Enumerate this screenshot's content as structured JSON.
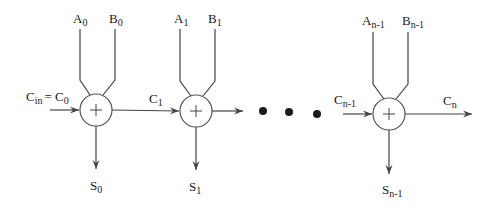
{
  "diagram": {
    "type": "ripple-carry-adder",
    "colors": {
      "line": "#444444",
      "text": "#1a1a1a",
      "background": "#ffffff"
    },
    "adders": [
      {
        "id": "adder-0",
        "symbol": "+",
        "inputs": {
          "a": {
            "base": "A",
            "sub": "0"
          },
          "b": {
            "base": "B",
            "sub": "0"
          }
        },
        "carry_in": {
          "base": "C",
          "sub": "in",
          "equals": "= ",
          "base2": "C",
          "sub2": "0"
        },
        "carry_out": {
          "base": "C",
          "sub": "1"
        },
        "sum": {
          "base": "S",
          "sub": "0"
        }
      },
      {
        "id": "adder-1",
        "symbol": "+",
        "inputs": {
          "a": {
            "base": "A",
            "sub": "1"
          },
          "b": {
            "base": "B",
            "sub": "1"
          }
        },
        "sum": {
          "base": "S",
          "sub": "1"
        }
      },
      {
        "id": "adder-n-1",
        "symbol": "+",
        "inputs": {
          "a": {
            "base": "A",
            "sub": "n-1"
          },
          "b": {
            "base": "B",
            "sub": "n-1"
          }
        },
        "carry_in": {
          "base": "C",
          "sub": "n-1"
        },
        "carry_out": {
          "base": "C",
          "sub": "n"
        },
        "sum": {
          "base": "S",
          "sub": "n-1"
        }
      }
    ],
    "ellipsis": "• • •"
  }
}
